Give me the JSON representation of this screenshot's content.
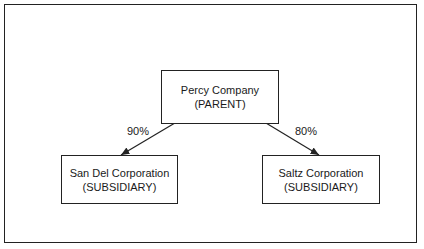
{
  "diagram": {
    "parent": {
      "name": "Percy Company",
      "role": "(PARENT)"
    },
    "subsidiaries": [
      {
        "name": "San Del Corporation",
        "role": "(SUBSIDIARY)",
        "ownership": "90%"
      },
      {
        "name": "Saltz Corporation",
        "role": "(SUBSIDIARY)",
        "ownership": "80%"
      }
    ]
  }
}
